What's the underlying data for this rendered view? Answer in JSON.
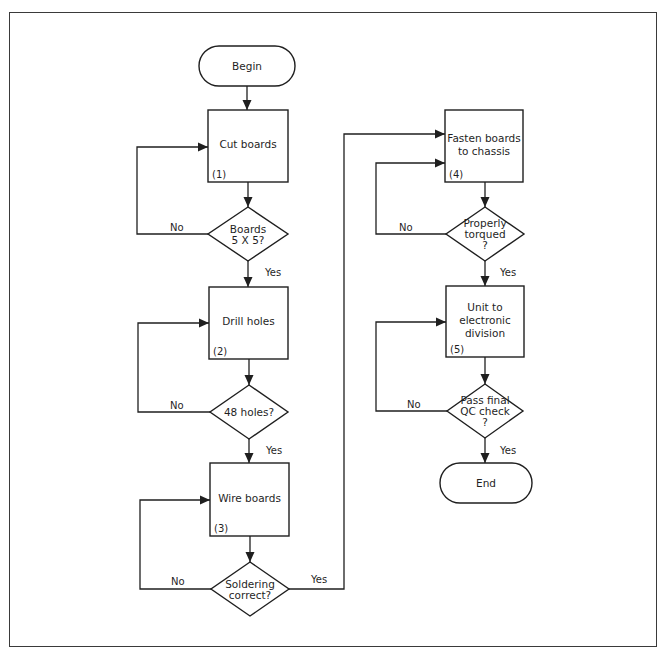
{
  "diagram": {
    "type": "flowchart",
    "nodes": [
      {
        "id": "begin",
        "kind": "terminal",
        "lines": [
          "Begin"
        ],
        "cx": 247,
        "cy": 66,
        "w": 96,
        "h": 40
      },
      {
        "id": "cut",
        "kind": "process",
        "lines": [
          "Cut boards"
        ],
        "number": "(1)",
        "x": 208,
        "y": 110,
        "w": 80,
        "h": 72
      },
      {
        "id": "dec1",
        "kind": "decision",
        "lines": [
          "Boards",
          "5 X 5?"
        ],
        "cx": 248,
        "cy": 234,
        "hw": 40,
        "hh": 27
      },
      {
        "id": "drill",
        "kind": "process",
        "lines": [
          "Drill holes"
        ],
        "number": "(2)",
        "x": 209,
        "y": 287,
        "w": 79,
        "h": 72
      },
      {
        "id": "dec2",
        "kind": "decision",
        "lines": [
          "48 holes?"
        ],
        "cx": 249,
        "cy": 412,
        "hw": 39,
        "hh": 27
      },
      {
        "id": "wire",
        "kind": "process",
        "lines": [
          "Wire boards"
        ],
        "number": "(3)",
        "x": 210,
        "y": 463,
        "w": 79,
        "h": 73
      },
      {
        "id": "dec3",
        "kind": "decision",
        "lines": [
          "Soldering",
          "correct?"
        ],
        "cx": 250,
        "cy": 589,
        "hw": 39,
        "hh": 27
      },
      {
        "id": "fasten",
        "kind": "process",
        "lines": [
          "Fasten boards",
          "to chassis"
        ],
        "number": "(4)",
        "x": 445,
        "y": 110,
        "w": 78,
        "h": 72
      },
      {
        "id": "dec4",
        "kind": "decision",
        "lines": [
          "Properly",
          "torqued",
          "?"
        ],
        "cx": 485,
        "cy": 234,
        "hw": 39,
        "hh": 27
      },
      {
        "id": "unit",
        "kind": "process",
        "lines": [
          "Unit to",
          "electronic",
          "division"
        ],
        "number": "(5)",
        "x": 446,
        "y": 286,
        "w": 78,
        "h": 71
      },
      {
        "id": "dec5",
        "kind": "decision",
        "lines": [
          "Pass final",
          "QC check",
          "?"
        ],
        "cx": 485,
        "cy": 411,
        "hw": 38,
        "hh": 27
      },
      {
        "id": "end",
        "kind": "terminal",
        "lines": [
          "End"
        ],
        "cx": 486,
        "cy": 483,
        "w": 92,
        "h": 40
      }
    ],
    "edges": [
      {
        "from": "begin",
        "to": "cut",
        "label": "",
        "points": [
          [
            247,
            86
          ],
          [
            247,
            110
          ]
        ]
      },
      {
        "from": "cut",
        "to": "dec1",
        "label": "",
        "points": [
          [
            248,
            182
          ],
          [
            248,
            207
          ]
        ]
      },
      {
        "from": "dec1",
        "to": "cut",
        "label": "No",
        "label_pos": [
          170,
          231
        ],
        "points": [
          [
            208,
            234
          ],
          [
            137,
            234
          ],
          [
            137,
            147
          ],
          [
            208,
            147
          ]
        ]
      },
      {
        "from": "dec1",
        "to": "drill",
        "label": "Yes",
        "label_pos": [
          265,
          276
        ],
        "points": [
          [
            248,
            261
          ],
          [
            248,
            287
          ]
        ]
      },
      {
        "from": "drill",
        "to": "dec2",
        "label": "",
        "points": [
          [
            249,
            359
          ],
          [
            249,
            385
          ]
        ]
      },
      {
        "from": "dec2",
        "to": "drill",
        "label": "No",
        "label_pos": [
          170,
          409
        ],
        "points": [
          [
            210,
            412
          ],
          [
            138,
            412
          ],
          [
            138,
            323
          ],
          [
            209,
            323
          ]
        ]
      },
      {
        "from": "dec2",
        "to": "wire",
        "label": "Yes",
        "label_pos": [
          266,
          454
        ],
        "points": [
          [
            249,
            439
          ],
          [
            249,
            463
          ]
        ]
      },
      {
        "from": "wire",
        "to": "dec3",
        "label": "",
        "points": [
          [
            250,
            536
          ],
          [
            250,
            562
          ]
        ]
      },
      {
        "from": "dec3",
        "to": "wire",
        "label": "No",
        "label_pos": [
          171,
          585
        ],
        "points": [
          [
            211,
            589
          ],
          [
            140,
            589
          ],
          [
            140,
            500
          ],
          [
            210,
            500
          ]
        ]
      },
      {
        "from": "dec3",
        "to": "fasten",
        "label": "Yes",
        "label_pos": [
          311,
          583
        ],
        "points": [
          [
            289,
            589
          ],
          [
            344,
            589
          ],
          [
            344,
            134
          ],
          [
            445,
            134
          ]
        ]
      },
      {
        "from": "fasten",
        "to": "dec4",
        "label": "",
        "points": [
          [
            485,
            182
          ],
          [
            485,
            207
          ]
        ]
      },
      {
        "from": "dec4",
        "to": "fasten",
        "label": "No",
        "label_pos": [
          399,
          231
        ],
        "points": [
          [
            446,
            234
          ],
          [
            376,
            234
          ],
          [
            376,
            163
          ],
          [
            445,
            163
          ]
        ]
      },
      {
        "from": "dec4",
        "to": "unit",
        "label": "Yes",
        "label_pos": [
          500,
          276
        ],
        "points": [
          [
            485,
            261
          ],
          [
            485,
            286
          ]
        ]
      },
      {
        "from": "unit",
        "to": "dec5",
        "label": "",
        "points": [
          [
            485,
            357
          ],
          [
            485,
            384
          ]
        ]
      },
      {
        "from": "dec5",
        "to": "unit",
        "label": "No",
        "label_pos": [
          407,
          408
        ],
        "points": [
          [
            447,
            411
          ],
          [
            376,
            411
          ],
          [
            376,
            322
          ],
          [
            446,
            322
          ]
        ]
      },
      {
        "from": "dec5",
        "to": "end",
        "label": "Yes",
        "label_pos": [
          500,
          454
        ],
        "points": [
          [
            485,
            438
          ],
          [
            485,
            463
          ]
        ]
      }
    ]
  }
}
